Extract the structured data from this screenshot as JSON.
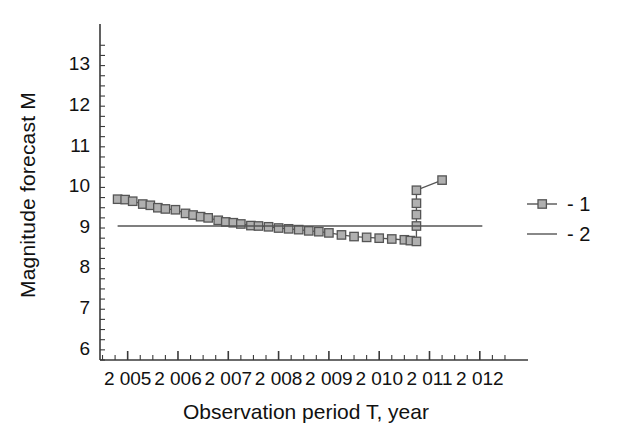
{
  "chart_data": {
    "type": "line",
    "title": "",
    "xlabel": "Observation period T, year",
    "ylabel": "Magnitude forecast  M",
    "xlim": [
      2004.45,
      2012.6
    ],
    "ylim": [
      5.72,
      13.6
    ],
    "grid": false,
    "legend_position": "right",
    "x_tick_labels": [
      "2 005",
      "2 006",
      "2 007",
      "2 008",
      "2 009",
      "2 010",
      "2 011",
      "2 012"
    ],
    "x_tick_values": [
      2005,
      2006,
      2007,
      2008,
      2009,
      2010,
      2011,
      2012
    ],
    "x_minor_tick_step": 0.25,
    "y_tick_labels": [
      "6",
      "7",
      "8",
      "9",
      "10",
      "11",
      "12",
      "13"
    ],
    "y_tick_values": [
      6,
      7,
      8,
      9,
      10,
      11,
      12,
      13
    ],
    "y_minor_tick_step": 0.25,
    "series": [
      {
        "name": "1",
        "legend_label": "- 1",
        "marker": "square",
        "color": "#555555",
        "marker_fill": "#b0b0b0",
        "x": [
          2004.8,
          2004.95,
          2005.1,
          2005.3,
          2005.45,
          2005.6,
          2005.75,
          2005.95,
          2006.15,
          2006.3,
          2006.45,
          2006.6,
          2006.8,
          2006.95,
          2007.1,
          2007.25,
          2007.45,
          2007.6,
          2007.8,
          2008.0,
          2008.2,
          2008.4,
          2008.6,
          2008.8,
          2009.0,
          2009.25,
          2009.5,
          2009.75,
          2010.0,
          2010.25,
          2010.5,
          2010.62,
          2010.74,
          2010.74,
          2010.74,
          2010.74,
          2010.74,
          2011.25
        ],
        "y": [
          9.68,
          9.67,
          9.63,
          9.56,
          9.53,
          9.47,
          9.44,
          9.42,
          9.33,
          9.29,
          9.25,
          9.22,
          9.16,
          9.12,
          9.1,
          9.07,
          9.03,
          9.02,
          9.0,
          8.97,
          8.95,
          8.93,
          8.9,
          8.88,
          8.85,
          8.8,
          8.76,
          8.74,
          8.72,
          8.7,
          8.68,
          8.66,
          8.64,
          9.02,
          9.3,
          9.58,
          9.9,
          10.15
        ]
      },
      {
        "name": "2",
        "legend_label": "- 2",
        "marker": "none",
        "color": "#555555",
        "x": [
          2004.8,
          2012.05
        ],
        "y": [
          9.02,
          9.02
        ]
      }
    ]
  },
  "legend": {
    "entries": [
      {
        "label": "- 1",
        "style": "line-with-square-marker"
      },
      {
        "label": "- 2",
        "style": "solid-line"
      }
    ]
  }
}
